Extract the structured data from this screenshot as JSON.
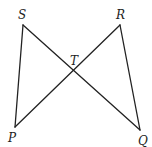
{
  "diagram": {
    "type": "geometry",
    "stroke_color": "#222222",
    "points": {
      "S": {
        "label": "S",
        "x": 23,
        "y": 25,
        "lx": 18,
        "ly": 19
      },
      "R": {
        "label": "R",
        "x": 120,
        "y": 25,
        "lx": 116,
        "ly": 19
      },
      "P": {
        "label": "P",
        "x": 15,
        "y": 127,
        "lx": 8,
        "ly": 142
      },
      "Q": {
        "label": "Q",
        "x": 140,
        "y": 130,
        "lx": 138,
        "ly": 145
      },
      "T": {
        "label": "T",
        "x": 73,
        "y": 71,
        "lx": 70,
        "ly": 65
      }
    },
    "segments": [
      {
        "from": "S",
        "to": "P"
      },
      {
        "from": "S",
        "to": "Q"
      },
      {
        "from": "R",
        "to": "P"
      },
      {
        "from": "R",
        "to": "Q"
      }
    ]
  }
}
